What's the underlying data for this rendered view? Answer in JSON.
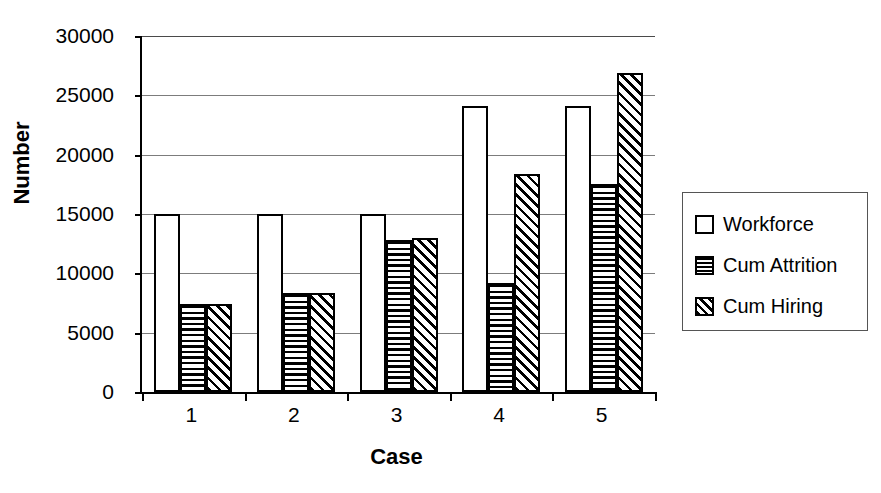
{
  "chart_data": {
    "type": "bar",
    "title": "",
    "subtitle": "",
    "xlabel": "Case",
    "ylabel": "Number",
    "categories": [
      "1",
      "2",
      "3",
      "4",
      "5"
    ],
    "series": [
      {
        "name": "Workforce",
        "pattern": "solid-white",
        "values": [
          15000,
          15000,
          15000,
          24100,
          24100
        ]
      },
      {
        "name": "Cum Attrition",
        "pattern": "horizontal",
        "values": [
          7400,
          8350,
          12800,
          9150,
          17500
        ]
      },
      {
        "name": "Cum Hiring",
        "pattern": "diagonal",
        "values": [
          7400,
          8350,
          12950,
          18400,
          26850
        ]
      }
    ],
    "ylim": [
      0,
      30000
    ],
    "yticks": [
      0,
      5000,
      10000,
      15000,
      20000,
      25000,
      30000
    ],
    "ytick_labels": [
      "0",
      "5000",
      "10000",
      "15000",
      "20000",
      "25000",
      "30000"
    ],
    "grid": true,
    "grid_axis": "y",
    "legend_position": "right",
    "legend_entries": [
      "Workforce",
      "Cum Attrition",
      "Cum Hiring"
    ],
    "colors": {
      "axis": "#000000",
      "grid": "#7c7c7c",
      "bar_outline": "#000000",
      "bar_fill": "#ffffff",
      "background": "#ffffff"
    }
  }
}
